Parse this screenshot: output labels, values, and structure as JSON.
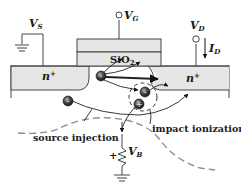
{
  "diagram": {
    "terminals": {
      "source": {
        "symbol": "V",
        "sub": "S"
      },
      "gate": {
        "symbol": "V",
        "sub": "G"
      },
      "drain": {
        "symbol": "V",
        "sub": "D"
      },
      "drain_current": {
        "symbol": "I",
        "sub": "D"
      },
      "body": {
        "symbol": "V",
        "sub": "B",
        "polarity": "+"
      }
    },
    "regions": {
      "source_region": {
        "label": "n",
        "sup": "+"
      },
      "drain_region": {
        "label": "n",
        "sup": "+"
      },
      "oxide": {
        "label": "SiO",
        "sub": "2"
      }
    },
    "annotations": {
      "source_injection": "source injection",
      "impact_ionization": "impact ionization"
    },
    "colors": {
      "fill_region": "#e6e6e6",
      "line": "#333333",
      "dashed": "#8a8a8a",
      "electron": "#3a3a3a"
    }
  }
}
